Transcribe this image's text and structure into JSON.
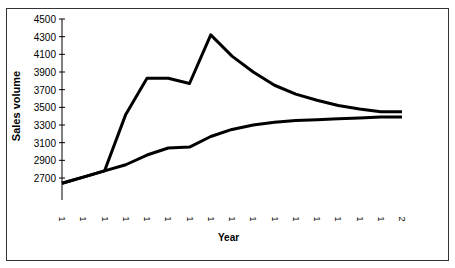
{
  "chart_data": {
    "type": "line",
    "title": "",
    "xlabel": "Year",
    "ylabel": "Sales volume",
    "ylim": [
      2500,
      4500
    ],
    "yticks": [
      2700,
      2900,
      3100,
      3300,
      3500,
      3700,
      3900,
      4100,
      4300,
      4500
    ],
    "categories": [
      "1",
      "1",
      "1",
      "1",
      "1",
      "1",
      "1",
      "1",
      "1",
      "1",
      "1",
      "1",
      "1",
      "1",
      "1",
      "1",
      "2"
    ],
    "series": [
      {
        "name": "Upper curve",
        "values": [
          2640,
          2710,
          2780,
          3420,
          3830,
          3830,
          3770,
          4320,
          4080,
          3900,
          3750,
          3650,
          3580,
          3520,
          3480,
          3450,
          3450
        ]
      },
      {
        "name": "Lower curve",
        "values": [
          2640,
          2710,
          2780,
          2850,
          2960,
          3040,
          3050,
          3170,
          3250,
          3300,
          3330,
          3350,
          3360,
          3370,
          3380,
          3390,
          3390
        ]
      }
    ],
    "grid": false,
    "legend": "none",
    "line_color": "#000000"
  }
}
